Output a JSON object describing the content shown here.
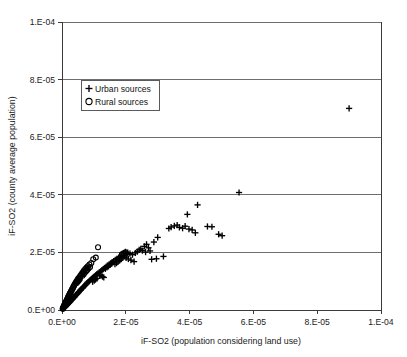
{
  "chart_data": {
    "type": "scatter",
    "title": "",
    "xlabel": "iF-SO2 (population considering land use)",
    "ylabel": "iF-SO2 (county average population)",
    "xlim": [
      0,
      0.0001
    ],
    "ylim": [
      0,
      0.0001
    ],
    "grid": true,
    "grid_axis": "y",
    "legend_position": "upper-left-inside",
    "xticks": [
      "0.E+00",
      "2.E-05",
      "4.E-05",
      "6.E-05",
      "8.E-05",
      "1.E-04"
    ],
    "xtick_values": [
      0,
      2e-05,
      4e-05,
      6e-05,
      8e-05,
      0.0001
    ],
    "yticks": [
      "0.E+00",
      "2.E-05",
      "4.E-05",
      "6.E-05",
      "8.E-05",
      "1.E-04"
    ],
    "ytick_values": [
      0,
      2e-05,
      4e-05,
      6e-05,
      8e-05,
      0.0001
    ],
    "series": [
      {
        "name": "Urban sources",
        "marker": "plus",
        "color": "#000000",
        "points": [
          [
            9e-05,
            7e-05
          ],
          [
            5.55e-05,
            4.08e-05
          ],
          [
            4.25e-05,
            3.65e-05
          ],
          [
            3.93e-05,
            3.32e-05
          ],
          [
            4.56e-05,
            2.9e-05
          ],
          [
            4.7e-05,
            2.89e-05
          ],
          [
            3.52e-05,
            2.92e-05
          ],
          [
            3.61e-05,
            2.95e-05
          ],
          [
            3.68e-05,
            2.87e-05
          ],
          [
            3.78e-05,
            2.84e-05
          ],
          [
            3.86e-05,
            2.91e-05
          ],
          [
            3.42e-05,
            2.88e-05
          ],
          [
            3.35e-05,
            2.83e-05
          ],
          [
            3.98e-05,
            2.81e-05
          ],
          [
            4.08e-05,
            2.78e-05
          ],
          [
            4.91e-05,
            2.63e-05
          ],
          [
            5.02e-05,
            2.58e-05
          ],
          [
            4.18e-05,
            2.68e-05
          ],
          [
            3e-05,
            2.52e-05
          ],
          [
            2.88e-05,
            2.36e-05
          ],
          [
            2.65e-05,
            2.28e-05
          ],
          [
            2.58e-05,
            2.21e-05
          ],
          [
            2.71e-05,
            2.16e-05
          ],
          [
            2.47e-05,
            2.12e-05
          ],
          [
            2.52e-05,
            2.06e-05
          ],
          [
            2.42e-05,
            2.09e-05
          ],
          [
            2.36e-05,
            2.03e-05
          ],
          [
            2.3e-05,
            1.98e-05
          ],
          [
            2.62e-05,
            2.01e-05
          ],
          [
            2.76e-05,
            2.05e-05
          ],
          [
            3.18e-05,
            1.86e-05
          ],
          [
            2.96e-05,
            1.78e-05
          ],
          [
            2.81e-05,
            1.76e-05
          ],
          [
            2.21e-05,
            1.92e-05
          ],
          [
            2.13e-05,
            1.96e-05
          ],
          [
            2.06e-05,
            1.99e-05
          ],
          [
            1.99e-05,
            2.02e-05
          ],
          [
            1.93e-05,
            1.95e-05
          ],
          [
            1.87e-05,
            1.9e-05
          ],
          [
            1.82e-05,
            1.86e-05
          ],
          [
            1.78e-05,
            1.82e-05
          ],
          [
            2.01e-05,
            1.81e-05
          ],
          [
            2.08e-05,
            1.77e-05
          ],
          [
            2.16e-05,
            1.73e-05
          ],
          [
            2.26e-05,
            1.68e-05
          ],
          [
            1.72e-05,
            1.78e-05
          ],
          [
            1.67e-05,
            1.74e-05
          ],
          [
            1.62e-05,
            1.7e-05
          ],
          [
            1.57e-05,
            1.66e-05
          ],
          [
            1.52e-05,
            1.62e-05
          ],
          [
            1.47e-05,
            1.58e-05
          ],
          [
            1.42e-05,
            1.54e-05
          ],
          [
            1.38e-05,
            1.5e-05
          ],
          [
            1.33e-05,
            1.46e-05
          ],
          [
            1.29e-05,
            1.42e-05
          ],
          [
            1.25e-05,
            1.38e-05
          ],
          [
            1.21e-05,
            1.34e-05
          ],
          [
            1.17e-05,
            1.31e-05
          ],
          [
            1.13e-05,
            1.27e-05
          ],
          [
            1.09e-05,
            1.24e-05
          ],
          [
            1.06e-05,
            1.21e-05
          ],
          [
            1.02e-05,
            1.17e-05
          ],
          [
            9.9e-06,
            1.14e-05
          ],
          [
            9.6e-06,
            1.11e-05
          ],
          [
            9.3e-06,
            1.08e-05
          ],
          [
            9e-06,
            1.05e-05
          ],
          [
            8.7e-06,
            1.02e-05
          ],
          [
            8.4e-06,
            9.9e-06
          ],
          [
            8.1e-06,
            9.6e-06
          ],
          [
            7.8e-06,
            9.3e-06
          ],
          [
            7.6e-06,
            9e-06
          ],
          [
            7.3e-06,
            8.7e-06
          ],
          [
            7.1e-06,
            8.4e-06
          ],
          [
            6.8e-06,
            8.1e-06
          ],
          [
            6.6e-06,
            7.8e-06
          ],
          [
            6.4e-06,
            7.6e-06
          ],
          [
            6.1e-06,
            7.3e-06
          ],
          [
            5.9e-06,
            7e-06
          ],
          [
            5.7e-06,
            6.8e-06
          ],
          [
            5.5e-06,
            6.5e-06
          ],
          [
            5.3e-06,
            6.3e-06
          ],
          [
            5.1e-06,
            6e-06
          ],
          [
            4.9e-06,
            5.8e-06
          ],
          [
            4.7e-06,
            5.5e-06
          ],
          [
            4.5e-06,
            5.3e-06
          ],
          [
            4.3e-06,
            5.1e-06
          ],
          [
            4.1e-06,
            4.8e-06
          ],
          [
            3.9e-06,
            4.6e-06
          ],
          [
            3.8e-06,
            4.4e-06
          ],
          [
            3.6e-06,
            4.2e-06
          ],
          [
            3.4e-06,
            4e-06
          ],
          [
            3.3e-06,
            3.8e-06
          ],
          [
            3.1e-06,
            3.6e-06
          ],
          [
            2.9e-06,
            3.4e-06
          ],
          [
            2.8e-06,
            3.2e-06
          ],
          [
            2.6e-06,
            3e-06
          ],
          [
            2.5e-06,
            2.8e-06
          ],
          [
            2.3e-06,
            2.6e-06
          ],
          [
            2.2e-06,
            2.5e-06
          ],
          [
            2e-06,
            2.3e-06
          ],
          [
            1.9e-06,
            2.1e-06
          ],
          [
            1.7e-06,
            1.9e-06
          ],
          [
            1.6e-06,
            1.8e-06
          ],
          [
            1.4e-06,
            1.6e-06
          ],
          [
            1.3e-06,
            1.4e-06
          ],
          [
            1.1e-06,
            1.2e-06
          ],
          [
            1e-06,
            1.1e-06
          ],
          [
            8e-07,
            9e-07
          ],
          [
            7e-07,
            8e-07
          ],
          [
            6e-07,
            6e-07
          ],
          [
            1.18e-05,
            1.22e-05
          ],
          [
            1.22e-05,
            1.19e-05
          ],
          [
            1.27e-05,
            1.16e-05
          ],
          [
            1.31e-05,
            1.13e-05
          ],
          [
            1.36e-05,
            1.43e-05
          ],
          [
            1.41e-05,
            1.48e-05
          ],
          [
            1.46e-05,
            1.52e-05
          ],
          [
            1.51e-05,
            1.57e-05
          ],
          [
            1.56e-05,
            1.61e-05
          ],
          [
            1.61e-05,
            1.66e-05
          ],
          [
            1.66e-05,
            1.59e-05
          ],
          [
            1.71e-05,
            1.63e-05
          ],
          [
            1.76e-05,
            1.68e-05
          ],
          [
            1.81e-05,
            1.72e-05
          ],
          [
            1.86e-05,
            1.77e-05
          ],
          [
            1.91e-05,
            1.82e-05
          ],
          [
            1.96e-05,
            1.87e-05
          ],
          [
            2.03e-05,
            1.92e-05
          ],
          [
            9.6e-06,
            9.8e-06
          ],
          [
            1.01e-05,
            1.02e-05
          ],
          [
            1.05e-05,
            1.06e-05
          ],
          [
            1.1e-05,
            1.1e-05
          ]
        ]
      },
      {
        "name": "Rural sources",
        "marker": "circle",
        "color": "#000000",
        "points": [
          [
            1.13e-05,
            2.18e-05
          ],
          [
            1.06e-05,
            1.82e-05
          ],
          [
            9.8e-06,
            1.76e-05
          ],
          [
            1.99e-05,
            2e-05
          ],
          [
            1.93e-05,
            1.97e-05
          ],
          [
            1.88e-05,
            1.93e-05
          ],
          [
            9.2e-06,
            1.63e-05
          ],
          [
            8.6e-06,
            1.58e-05
          ],
          [
            8.1e-06,
            1.52e-05
          ],
          [
            7.7e-06,
            1.47e-05
          ],
          [
            7.3e-06,
            1.42e-05
          ],
          [
            6.9e-06,
            1.37e-05
          ],
          [
            6.6e-06,
            1.32e-05
          ],
          [
            6.3e-06,
            1.27e-05
          ],
          [
            6e-06,
            1.22e-05
          ],
          [
            5.7e-06,
            1.18e-05
          ],
          [
            5.4e-06,
            1.13e-05
          ],
          [
            5.1e-06,
            1.09e-05
          ],
          [
            4.9e-06,
            1.05e-05
          ],
          [
            4.7e-06,
            1.01e-05
          ],
          [
            4.4e-06,
            9.7e-06
          ],
          [
            4.2e-06,
            9.3e-06
          ],
          [
            4e-06,
            8.9e-06
          ],
          [
            3.8e-06,
            8.5e-06
          ],
          [
            3.6e-06,
            8.1e-06
          ],
          [
            3.5e-06,
            7.8e-06
          ],
          [
            3.3e-06,
            7.4e-06
          ],
          [
            3.1e-06,
            7.1e-06
          ],
          [
            3e-06,
            6.7e-06
          ],
          [
            2.8e-06,
            6.4e-06
          ],
          [
            2.7e-06,
            6.1e-06
          ],
          [
            2.5e-06,
            5.8e-06
          ],
          [
            2.4e-06,
            5.5e-06
          ],
          [
            2.3e-06,
            5.2e-06
          ],
          [
            2.1e-06,
            4.9e-06
          ],
          [
            2e-06,
            4.6e-06
          ],
          [
            1.9e-06,
            4.3e-06
          ],
          [
            1.8e-06,
            4.1e-06
          ],
          [
            1.7e-06,
            3.8e-06
          ],
          [
            1.6e-06,
            3.6e-06
          ],
          [
            1.5e-06,
            3.3e-06
          ],
          [
            1.4e-06,
            3.1e-06
          ],
          [
            1.3e-06,
            2.9e-06
          ],
          [
            1.2e-06,
            2.7e-06
          ],
          [
            1.1e-06,
            2.5e-06
          ],
          [
            1e-06,
            2.3e-06
          ],
          [
            9e-07,
            2.1e-06
          ],
          [
            8e-07,
            1.9e-06
          ],
          [
            8e-07,
            1.7e-06
          ],
          [
            7e-07,
            1.5e-06
          ],
          [
            6e-07,
            1.3e-06
          ],
          [
            5e-07,
            1.1e-06
          ],
          [
            5e-07,
            9e-07
          ],
          [
            4e-07,
            8e-07
          ],
          [
            3e-07,
            6e-07
          ],
          [
            3e-07,
            5e-07
          ],
          [
            2e-07,
            4e-07
          ],
          [
            6.4e-06,
            1.19e-05
          ],
          [
            6.8e-06,
            1.24e-05
          ],
          [
            7.1e-06,
            1.29e-05
          ],
          [
            7.5e-06,
            1.34e-05
          ],
          [
            7.9e-06,
            1.39e-05
          ],
          [
            8.3e-06,
            1.44e-05
          ],
          [
            8.8e-06,
            1.49e-05
          ],
          [
            5.6e-06,
            1.08e-05
          ],
          [
            5.3e-06,
            1.03e-05
          ],
          [
            5e-06,
            9.9e-06
          ],
          [
            4.6e-06,
            9.4e-06
          ]
        ]
      }
    ]
  },
  "legend": {
    "items": [
      {
        "label": "Urban sources",
        "marker": "plus"
      },
      {
        "label": "Rural sources",
        "marker": "circle"
      }
    ]
  }
}
